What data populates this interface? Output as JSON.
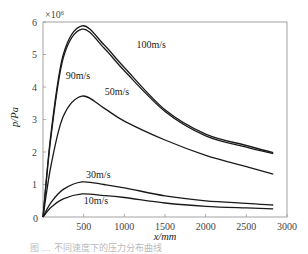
{
  "chart_data": {
    "type": "line",
    "title": "",
    "xlabel": "x/mm",
    "ylabel": "p/Pa",
    "y_multiplier": "×10⁶",
    "xlim": [
      0,
      3000
    ],
    "ylim": [
      0,
      6
    ],
    "x_ticks": [
      "500",
      "1000",
      "1500",
      "2000",
      "2500",
      "3000"
    ],
    "y_ticks": [
      "0",
      "1",
      "2",
      "3",
      "4",
      "5",
      "6"
    ],
    "grid": false,
    "legend": "inline curve labels",
    "x": [
      0,
      100,
      250,
      480,
      750,
      1000,
      1500,
      2000,
      2500,
      2830
    ],
    "series": [
      {
        "name": "100m/s",
        "values": [
          0,
          2.6,
          5.0,
          5.88,
          5.3,
          4.6,
          3.3,
          2.55,
          2.2,
          1.98
        ]
      },
      {
        "name": "90m/s",
        "values": [
          0,
          2.5,
          4.9,
          5.78,
          5.2,
          4.5,
          3.25,
          2.5,
          2.15,
          1.95
        ]
      },
      {
        "name": "50m/s",
        "values": [
          0,
          1.6,
          3.1,
          3.72,
          3.35,
          2.95,
          2.37,
          1.9,
          1.55,
          1.32
        ]
      },
      {
        "name": "30m/s",
        "values": [
          0,
          0.45,
          0.85,
          1.08,
          1.0,
          0.9,
          0.65,
          0.5,
          0.42,
          0.37
        ]
      },
      {
        "name": "10m/s",
        "values": [
          0,
          0.3,
          0.56,
          0.71,
          0.66,
          0.6,
          0.43,
          0.33,
          0.28,
          0.25
        ]
      }
    ],
    "annotations": [
      {
        "text": "100m/s",
        "x": 1150,
        "y": 5.2
      },
      {
        "text": "90m/s",
        "x": 280,
        "y": 4.25
      },
      {
        "text": "50m/s",
        "x": 760,
        "y": 3.75
      },
      {
        "text": "30m/s",
        "x": 530,
        "y": 1.2
      },
      {
        "text": "10m/s",
        "x": 500,
        "y": 0.4
      }
    ]
  },
  "caption": "图 …  不同速度下的压力分布曲线"
}
